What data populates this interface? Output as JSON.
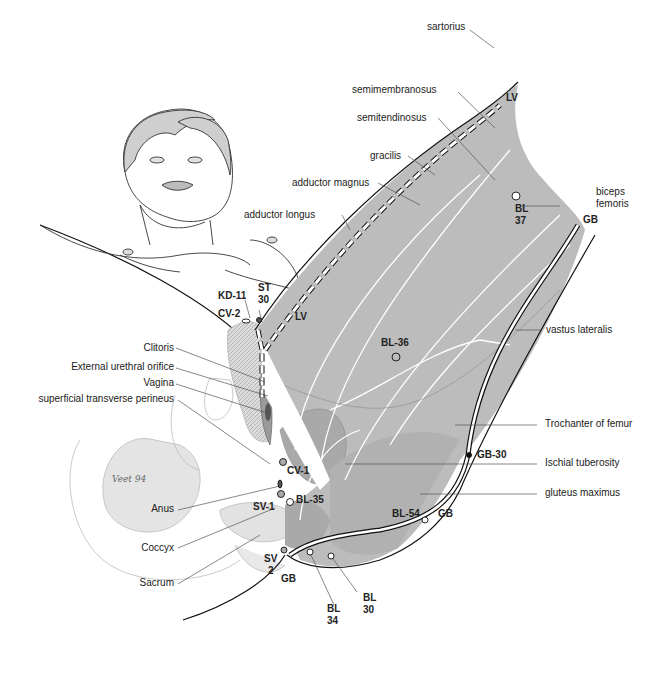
{
  "diagram": {
    "colors": {
      "muscle_fill": "#b9b9b9",
      "muscle_dark": "#a8a8a8",
      "line": "#111111",
      "muscle_line": "#ffffff",
      "pelvis_fill": "#e6e6e6",
      "hair_fill": "#c8c8c8"
    },
    "muscle_labels": {
      "sartorius": "sartorius",
      "semimembranosus": "semimembranosus",
      "semitendinosus": "semitendinosus",
      "gracilis": "gracilis",
      "adductor_magnus": "adductor magnus",
      "adductor_longus": "adductor longus",
      "biceps_femoris_1": "biceps",
      "biceps_femoris_2": "femoris",
      "vastus_lateralis": "vastus lateralis",
      "trochanter": "Trochanter of femur",
      "ischial_tuberosity": "Ischial tuberosity",
      "gluteus_maximus": "gluteus maximus"
    },
    "anatomy_labels": {
      "clitoris": "Clitoris",
      "urethral_orifice": "External urethral orifice",
      "vagina": "Vagina",
      "perineus": "superficial transverse perineus",
      "anus": "Anus",
      "coccyx": "Coccyx",
      "sacrum": "Sacrum"
    },
    "points": {
      "lv_top": "LV",
      "lv_mid": "LV",
      "gb_top": "GB",
      "gb_mid": "GB",
      "gb_bottom": "GB",
      "bl37_a": "BL",
      "bl37_b": "37",
      "bl36": "BL-36",
      "gb30": "GB-30",
      "bl54": "BL-54",
      "bl35": "BL-35",
      "bl34_a": "BL",
      "bl34_b": "34",
      "bl30_a": "BL",
      "bl30_b": "30",
      "st30_a": "ST",
      "st30_b": "30",
      "kd11": "KD-11",
      "cv2": "CV-2",
      "cv1": "CV-1",
      "sv1": "SV-1",
      "sv2_a": "SV",
      "sv2_b": "2"
    },
    "signature": "Veet 94"
  }
}
